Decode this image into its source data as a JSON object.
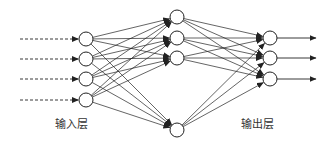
{
  "diagram": {
    "type": "neural-network",
    "colors": {
      "stroke": "#222222",
      "background": "#ffffff",
      "text": "#333333"
    },
    "node_radius": 7,
    "layers": [
      {
        "name": "input",
        "x": 86,
        "nodes_y": [
          39,
          59,
          79,
          100
        ]
      },
      {
        "name": "hidden",
        "x": 177,
        "nodes_y": [
          17,
          38,
          58,
          130
        ]
      },
      {
        "name": "output",
        "x": 270,
        "nodes_y": [
          38,
          58,
          79
        ]
      }
    ],
    "input_arrows": {
      "style": "dashed",
      "x_start": 20
    },
    "output_arrows": {
      "style": "solid",
      "x_end": 316
    },
    "connections": "fully-connected"
  },
  "labels": {
    "input_layer": "输入层",
    "output_layer": "输出层"
  }
}
